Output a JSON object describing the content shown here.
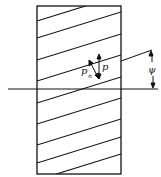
{
  "diagram": {
    "type": "helical-gear-tooth-development",
    "labels": {
      "normal_pitch": "p",
      "normal_pitch_sub": "n",
      "axial_pitch": "p",
      "helix_angle": "ψ"
    },
    "colors": {
      "stroke": "#111111",
      "background": "#ffffff"
    }
  }
}
